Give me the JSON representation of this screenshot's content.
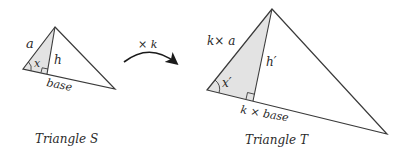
{
  "colors": {
    "stroke": "#3a3a3a",
    "shade": "#e3e3e3",
    "text": "#2a2a2a"
  },
  "arrow": {
    "label": "× k"
  },
  "triangle_s": {
    "caption": "Triangle S",
    "side_label": "a",
    "height_label": "h",
    "angle_label": "x",
    "base_label": "base",
    "vertices": {
      "apex": [
        55,
        27
      ],
      "left": [
        23,
        69
      ],
      "right": [
        115,
        89
      ],
      "foot": [
        47,
        74
      ]
    }
  },
  "triangle_t": {
    "caption": "Triangle T",
    "side_label": "k× a",
    "height_label": "h′",
    "angle_label": "x′",
    "base_label": "k × base",
    "vertices": {
      "apex": [
        272,
        9
      ],
      "left": [
        207,
        90
      ],
      "right": [
        387,
        134
      ],
      "foot": [
        253,
        101
      ]
    }
  }
}
